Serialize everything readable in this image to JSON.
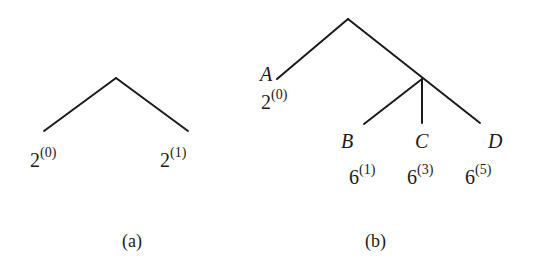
{
  "figure": {
    "a": {
      "caption": "(a)",
      "leaves": [
        {
          "base": "2",
          "exp": "(0)"
        },
        {
          "base": "2",
          "exp": "(1)"
        }
      ]
    },
    "b": {
      "caption": "(b)",
      "nodes": [
        {
          "name": "A",
          "base": "2",
          "exp": "(0)"
        },
        {
          "name": "B",
          "base": "6",
          "exp": "(1)"
        },
        {
          "name": "C",
          "base": "6",
          "exp": "(3)"
        },
        {
          "name": "D",
          "base": "6",
          "exp": "(5)"
        }
      ]
    },
    "line_color": "#1a1a1a"
  }
}
